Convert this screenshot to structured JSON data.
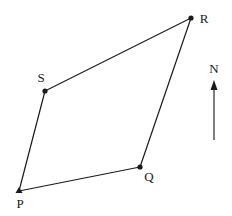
{
  "diagram": {
    "type": "quadrilateral-map",
    "points": [
      {
        "id": "P",
        "label": "P",
        "x": 19,
        "y": 191,
        "marker": "triangle",
        "label_x": 20,
        "label_y": 208
      },
      {
        "id": "Q",
        "label": "Q",
        "x": 140,
        "y": 167,
        "marker": "dot",
        "label_x": 149,
        "label_y": 181
      },
      {
        "id": "R",
        "label": "R",
        "x": 191,
        "y": 18,
        "marker": "dot",
        "label_x": 204,
        "label_y": 23
      },
      {
        "id": "S",
        "label": "S",
        "x": 45,
        "y": 91,
        "marker": "dot",
        "label_x": 41,
        "label_y": 82
      }
    ],
    "edges": [
      [
        "P",
        "Q"
      ],
      [
        "Q",
        "R"
      ],
      [
        "R",
        "S"
      ],
      [
        "S",
        "P"
      ]
    ],
    "north_arrow": {
      "label": "N",
      "x": 214,
      "y_top": 82,
      "y_bottom": 140,
      "label_y": 73
    },
    "colors": {
      "line": "#1a1a1a",
      "background": "#ffffff"
    }
  }
}
